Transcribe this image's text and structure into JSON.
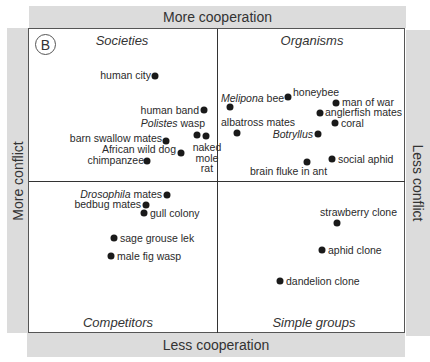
{
  "panel_label": "B",
  "axes": {
    "top": "More cooperation",
    "bottom": "Less cooperation",
    "left": "More conflict",
    "right": "Less conflict"
  },
  "quadrants": {
    "top_left": "Societies",
    "top_right": "Organisms",
    "bottom_left": "Competitors",
    "bottom_right": "Simple groups"
  },
  "points": [
    {
      "label": "human city",
      "x": 155,
      "y": 76
    },
    {
      "label": "human band",
      "x": 204,
      "y": 110
    },
    {
      "label": "Polistes wasp",
      "italic_part": "Polistes",
      "rest": " wasp",
      "x": 197,
      "y": 135
    },
    {
      "label": "naked mole rat",
      "x": 206,
      "y": 136
    },
    {
      "label": "barn swallow mates",
      "x": 166,
      "y": 141
    },
    {
      "label": "African wild dog",
      "x": 181,
      "y": 153
    },
    {
      "label": "chimpanzee",
      "x": 147,
      "y": 161
    },
    {
      "label": "Melipona bee",
      "italic_part": "Melipona",
      "rest": " bee",
      "x": 230,
      "y": 107
    },
    {
      "label": "honeybee",
      "x": 288,
      "y": 97
    },
    {
      "label": "man of war",
      "x": 336,
      "y": 103
    },
    {
      "label": "anglerfish mates",
      "x": 320,
      "y": 113
    },
    {
      "label": "coral",
      "x": 335,
      "y": 123
    },
    {
      "label": "albatross mates",
      "x": 237,
      "y": 133
    },
    {
      "label": "Botryllus",
      "italic_part": "Botryllus",
      "rest": "",
      "x": 318,
      "y": 134
    },
    {
      "label": "brain fluke in ant",
      "x": 307,
      "y": 162
    },
    {
      "label": "social aphid",
      "x": 332,
      "y": 159
    },
    {
      "label": "Drosophila mates",
      "italic_part": "Drosophila",
      "rest": " mates",
      "x": 167,
      "y": 195
    },
    {
      "label": "bedbug mates",
      "x": 146,
      "y": 205
    },
    {
      "label": "gull colony",
      "x": 144,
      "y": 213
    },
    {
      "label": "sage grouse lek",
      "x": 114,
      "y": 238
    },
    {
      "label": "male fig wasp",
      "x": 111,
      "y": 256
    },
    {
      "label": "strawberry clone",
      "x": 337,
      "y": 223
    },
    {
      "label": "aphid clone",
      "x": 322,
      "y": 250
    },
    {
      "label": "dandelion clone",
      "x": 280,
      "y": 281
    }
  ]
}
